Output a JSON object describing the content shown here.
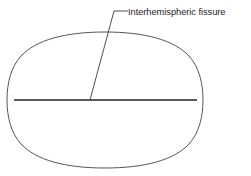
{
  "figure": {
    "type": "anatomical-line-diagram",
    "background_color": "#ffffff"
  },
  "shapes": {
    "brain_outline": {
      "name": "brain-outline",
      "shape": "rounded-oval",
      "stroke_color": "#555555",
      "stroke_width": 1,
      "fill": "none",
      "center_x": 105,
      "center_y": 100,
      "radius_x": 97,
      "radius_y": 68
    },
    "midline": {
      "name": "interhemispheric-fissure-line",
      "shape": "horizontal-line",
      "stroke_color": "#222222",
      "stroke_width": 1.7,
      "x1": 14,
      "y1": 100,
      "x2": 197,
      "y2": 100
    },
    "leader": {
      "name": "leader-line",
      "stroke_color": "#3a3a3a",
      "stroke_width": 0.9,
      "points": "90,100 114,11 128,11"
    }
  },
  "labels": {
    "fissure": {
      "text": "Interhemispheric fissure",
      "x": 128,
      "y": 15,
      "color": "#1c1c1c"
    }
  }
}
